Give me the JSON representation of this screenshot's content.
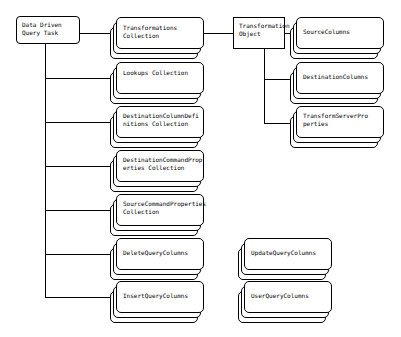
{
  "diagram": {
    "background_color": "#ffffff",
    "line_color": "#000000",
    "text_color": "#000000",
    "root": {
      "label": "Data Driven\nQuery Task",
      "shape": "rounded-rectangle"
    },
    "transformation_object": {
      "label": "Transformation\nObject",
      "shape": "rectangle"
    },
    "task_children": [
      {
        "label": "Transformations\nCollection",
        "shape": "stacked-rounded-rectangle"
      },
      {
        "label": "Lookups Collection",
        "shape": "stacked-rounded-rectangle"
      },
      {
        "label": "DestinationColumnDefi\nnitions Collection",
        "shape": "stacked-rounded-rectangle"
      },
      {
        "label": "DestinationCommandProp\nerties Collection",
        "shape": "stacked-rounded-rectangle"
      },
      {
        "label": "SourceCommandProperties\nCollection",
        "shape": "stacked-rounded-rectangle"
      },
      {
        "label": "DeleteQueryColumns",
        "shape": "stacked-rounded-rectangle"
      },
      {
        "label": "InsertQueryColumns",
        "shape": "stacked-rounded-rectangle"
      }
    ],
    "transformation_children": [
      {
        "label": "SourceColumns",
        "shape": "stacked-rounded-rectangle"
      },
      {
        "label": "DestinationColumns",
        "shape": "stacked-rounded-rectangle"
      },
      {
        "label": "TransformServerPro\nperties",
        "shape": "stacked-rounded-rectangle"
      }
    ],
    "detached_nodes": [
      {
        "label": "UpdateQueryColumns",
        "shape": "stacked-rounded-rectangle"
      },
      {
        "label": "UserQueryColumns",
        "shape": "stacked-rounded-rectangle"
      }
    ]
  }
}
